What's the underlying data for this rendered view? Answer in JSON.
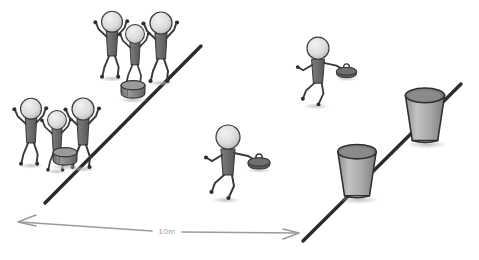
{
  "illustration": {
    "title": "Curling relay drill diagram",
    "style": "hand-drawn sketch",
    "background_color": "#ffffff",
    "ink_color": "#2b2b2b",
    "figure_fill": "#6e6e6e",
    "head_fill": "#d9d9d9",
    "stone_fill": "#555555",
    "bucket_fill": "#a8a8a8",
    "dimension_color": "#9b9b9b",
    "shadow_color": "#c9c9c9"
  },
  "dimension": {
    "label": "10m",
    "arrow_style": "double-headed",
    "left_arrow": "arrow-left",
    "right_arrow": "arrow-right"
  },
  "lines": [
    {
      "name": "left-diagonal-line",
      "from_x": 45,
      "from_y": 202,
      "to_x": 201,
      "to_y": 46
    },
    {
      "name": "right-diagonal-line",
      "from_x": 303,
      "from_y": 241,
      "to_x": 461,
      "to_y": 84
    }
  ],
  "groups": [
    {
      "name": "upper-cheering-group",
      "count": 3,
      "description": "three stick figures cheering with raised arms"
    },
    {
      "name": "lower-cheering-group",
      "count": 3,
      "description": "three stick figures cheering with raised arms"
    }
  ],
  "runners": [
    {
      "name": "runner-lower",
      "description": "stick figure running carrying a curling stone"
    },
    {
      "name": "runner-upper",
      "description": "stick figure running carrying a curling stone"
    }
  ],
  "stones": [
    {
      "name": "curling-stone-upper-group",
      "type": "puck"
    },
    {
      "name": "curling-stone-lower-group",
      "type": "puck"
    }
  ],
  "buckets": [
    {
      "name": "bucket-lower",
      "type": "bucket"
    },
    {
      "name": "bucket-upper",
      "type": "bucket"
    }
  ]
}
